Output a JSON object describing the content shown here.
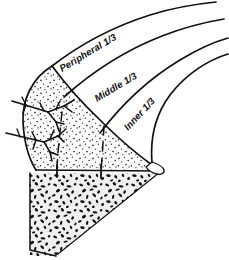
{
  "figure": {
    "kind": "anatomical-line-drawing",
    "background_color": "#ffffff",
    "ink_color": "#101010"
  },
  "zones": [
    {
      "id": "peripheral",
      "label": "Peripheral 1/3",
      "rotation_deg": -31,
      "x": 62,
      "y": 72,
      "description": "outermost vascularized red-red zone"
    },
    {
      "id": "middle",
      "label": "Middle 1/3",
      "rotation_deg": -31,
      "x": 97,
      "y": 102,
      "description": "red-white transitional zone"
    },
    {
      "id": "inner",
      "label": "Inner 1/3",
      "rotation_deg": -47,
      "x": 128,
      "y": 131,
      "description": "avascular white-white zone"
    }
  ],
  "regions": {
    "meniscus_body": {
      "name": "meniscus-body",
      "fill": "#fdfdfd",
      "texture": "stipple",
      "stipple_color": "#1a1a1a"
    },
    "subchondral_bone": {
      "name": "subchondral-bone",
      "fill": "#f0f0f0",
      "texture": "trabecular",
      "trabecular_color": "#111111"
    }
  },
  "features": {
    "vessels": {
      "name": "perimeniscal-vessels",
      "count": 2,
      "color": "#101010",
      "description": "branching capillary vessels entering from the peripheral capsular margin"
    },
    "division_lines": {
      "name": "zone-division-lines",
      "count": 2,
      "style": "dashed",
      "color": "#101010"
    },
    "tick_marks": {
      "name": "baseline-tick-marks",
      "count": 2,
      "color": "#101010"
    },
    "arcs": {
      "name": "zone-boundary-arcs",
      "count": 4,
      "color": "#101010"
    }
  }
}
